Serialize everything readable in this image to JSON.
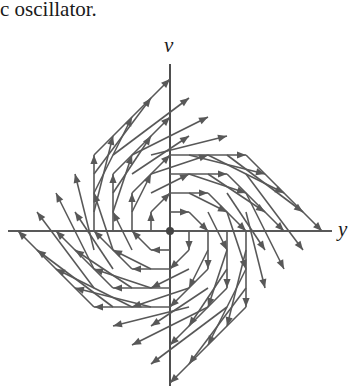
{
  "caption": "c oscillator.",
  "axes": {
    "horizontal_label": "y",
    "vertical_label": "v"
  },
  "field": {
    "description": "Direction field of harmonic oscillator: dy/dt = v, dv/dt = -y",
    "grid_min": -4,
    "grid_max": 4,
    "grid_step": 1,
    "origin_px": [
      170,
      231
    ],
    "unit_px": 19,
    "vector_scale": 1,
    "equilibrium_point": [
      0,
      0
    ]
  },
  "colors": {
    "arrow": "#585858",
    "axis": "#222222",
    "text": "#1a1a1a"
  }
}
